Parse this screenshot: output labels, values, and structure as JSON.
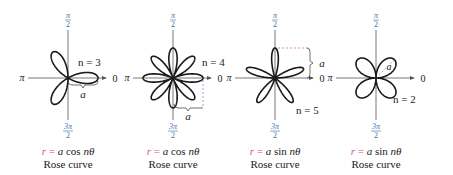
{
  "figure": {
    "panels": [
      {
        "id": "cos3",
        "equation": {
          "r": "r",
          "eq": "=",
          "a": "a",
          "fn": "cos",
          "arg": "nθ"
        },
        "trig": "cos",
        "n": 3,
        "n_label": "n = 3",
        "caption": "Rose curve",
        "a_label": "a",
        "a_marker": "bracket-below-x"
      },
      {
        "id": "cos4",
        "equation": {
          "r": "r",
          "eq": "=",
          "a": "a",
          "fn": "cos",
          "arg": "nθ"
        },
        "trig": "cos",
        "n": 4,
        "n_label": "n = 4",
        "caption": "Rose curve",
        "a_label": "a",
        "a_marker": "dashed-bracket-below"
      },
      {
        "id": "sin5",
        "equation": {
          "r": "r",
          "eq": "=",
          "a": "a",
          "fn": "sin",
          "arg": "nθ"
        },
        "trig": "sin",
        "n": 5,
        "n_label": "n = 5",
        "caption": "Rose curve",
        "a_label": "a",
        "a_marker": "dashed-bracket-right"
      },
      {
        "id": "sin2",
        "equation": {
          "r": "r",
          "eq": "=",
          "a": "a",
          "fn": "sin",
          "arg": "nθ"
        },
        "trig": "sin",
        "n": 2,
        "n_label": "n = 2",
        "caption": "Rose curve",
        "a_label": "a",
        "a_marker": "dashed-radius"
      }
    ],
    "axis_labels": {
      "top": "π/2",
      "top_num": "π",
      "top_den": "2",
      "left": "π",
      "right": "0",
      "bottom_num": "3π",
      "bottom_den": "2"
    },
    "colors": {
      "curve": "#1a1a1a",
      "axis": "#555555",
      "label_blue": "#3a6ea5",
      "accent_pink": "#d4577a",
      "dash_blue": "#5a7fc0"
    }
  }
}
